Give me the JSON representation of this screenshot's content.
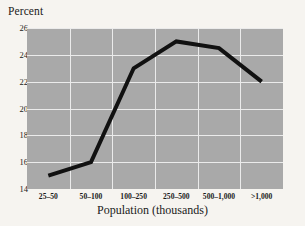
{
  "chart_data": {
    "type": "line",
    "title": "",
    "xlabel": "Population (thousands)",
    "ylabel": "Percent",
    "categories": [
      "25–50",
      "50–100",
      "100–250",
      "250–500",
      "500–1,000",
      ">1,000"
    ],
    "values": [
      15,
      16,
      23,
      25,
      24.5,
      22
    ],
    "series": [
      {
        "name": "Percent",
        "values": [
          15,
          16,
          23,
          25,
          24.5,
          22
        ]
      }
    ],
    "ylim": [
      14,
      26
    ],
    "yticks": [
      26,
      24,
      22,
      20,
      18,
      16,
      14
    ],
    "ytick_labels": [
      "26",
      "24",
      "22",
      "20",
      "18",
      "16",
      "14"
    ],
    "grid": true,
    "legend": "none",
    "colors": {
      "plot_background": "#a9a9a9",
      "page_background": "#f6f4f0",
      "gridline": "#ebebeb",
      "line": "#111111",
      "text": "#1a1a1a"
    }
  }
}
